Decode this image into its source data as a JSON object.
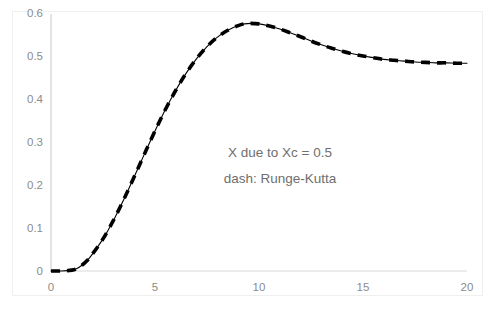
{
  "chart_data": {
    "type": "line",
    "title": "",
    "subtitle": "",
    "xlabel": "",
    "ylabel": "",
    "xlim": [
      0,
      20
    ],
    "ylim": [
      0,
      0.6
    ],
    "grid": false,
    "legend_position": "none",
    "x_ticks": [
      "0",
      "5",
      "10",
      "15",
      "20"
    ],
    "x_tick_values": [
      0,
      5,
      10,
      15,
      20
    ],
    "y_ticks": [
      "0",
      "0.1",
      "0.2",
      "0.3",
      "0.4",
      "0.5",
      "0.6"
    ],
    "y_tick_values": [
      0,
      0.1,
      0.2,
      0.3,
      0.4,
      0.5,
      0.6
    ],
    "annotations": [
      "X due to Xc = 0.5",
      "dash: Runge-Kutta"
    ],
    "series": [
      {
        "name": "X due to Xc = 0.5",
        "style": "solid",
        "color": "#000000",
        "x": [
          0,
          0.5,
          1.0,
          1.25,
          1.5,
          1.75,
          2.0,
          2.5,
          3.0,
          3.5,
          4.0,
          4.5,
          5.0,
          5.5,
          6.0,
          6.5,
          7.0,
          7.5,
          8.0,
          8.5,
          9.0,
          9.3,
          9.6,
          10.0,
          10.5,
          11.0,
          11.5,
          12.0,
          12.5,
          13.0,
          13.5,
          14.0,
          14.5,
          15.0,
          15.5,
          16.0,
          16.5,
          17.0,
          17.5,
          18.0,
          18.5,
          19.0,
          19.5,
          20.0
        ],
        "y": [
          0.0,
          0.0,
          0.002,
          0.006,
          0.014,
          0.025,
          0.04,
          0.075,
          0.118,
          0.167,
          0.22,
          0.274,
          0.327,
          0.377,
          0.422,
          0.462,
          0.496,
          0.524,
          0.546,
          0.562,
          0.573,
          0.577,
          0.578,
          0.577,
          0.572,
          0.565,
          0.556,
          0.547,
          0.537,
          0.528,
          0.52,
          0.513,
          0.507,
          0.502,
          0.498,
          0.494,
          0.492,
          0.49,
          0.488,
          0.487,
          0.486,
          0.486,
          0.485,
          0.485
        ]
      },
      {
        "name": "Runge-Kutta",
        "style": "dash",
        "color": "#000000",
        "x": [
          0,
          0.5,
          1.0,
          1.25,
          1.5,
          1.75,
          2.0,
          2.5,
          3.0,
          3.5,
          4.0,
          4.5,
          5.0,
          5.5,
          6.0,
          6.5,
          7.0,
          7.5,
          8.0,
          8.5,
          9.0,
          9.3,
          9.6,
          10.0,
          10.5,
          11.0,
          11.5,
          12.0,
          12.5,
          13.0,
          13.5,
          14.0,
          14.5,
          15.0,
          15.5,
          16.0,
          16.5,
          17.0,
          17.5,
          18.0,
          18.5,
          19.0,
          19.5,
          20.0
        ],
        "y": [
          0.0,
          0.0,
          0.002,
          0.006,
          0.014,
          0.025,
          0.04,
          0.075,
          0.118,
          0.167,
          0.22,
          0.274,
          0.327,
          0.377,
          0.422,
          0.462,
          0.496,
          0.524,
          0.546,
          0.562,
          0.573,
          0.577,
          0.578,
          0.577,
          0.572,
          0.565,
          0.556,
          0.547,
          0.537,
          0.528,
          0.52,
          0.513,
          0.507,
          0.502,
          0.498,
          0.494,
          0.492,
          0.49,
          0.488,
          0.487,
          0.486,
          0.486,
          0.485,
          0.485
        ]
      }
    ],
    "colors": {
      "curve": "#000000",
      "axis": "#d9d9d9",
      "tick_text": "#8c8c8c",
      "annotation_text": "#6e6e6e",
      "frame": "#efefef",
      "background": "#ffffff"
    }
  }
}
